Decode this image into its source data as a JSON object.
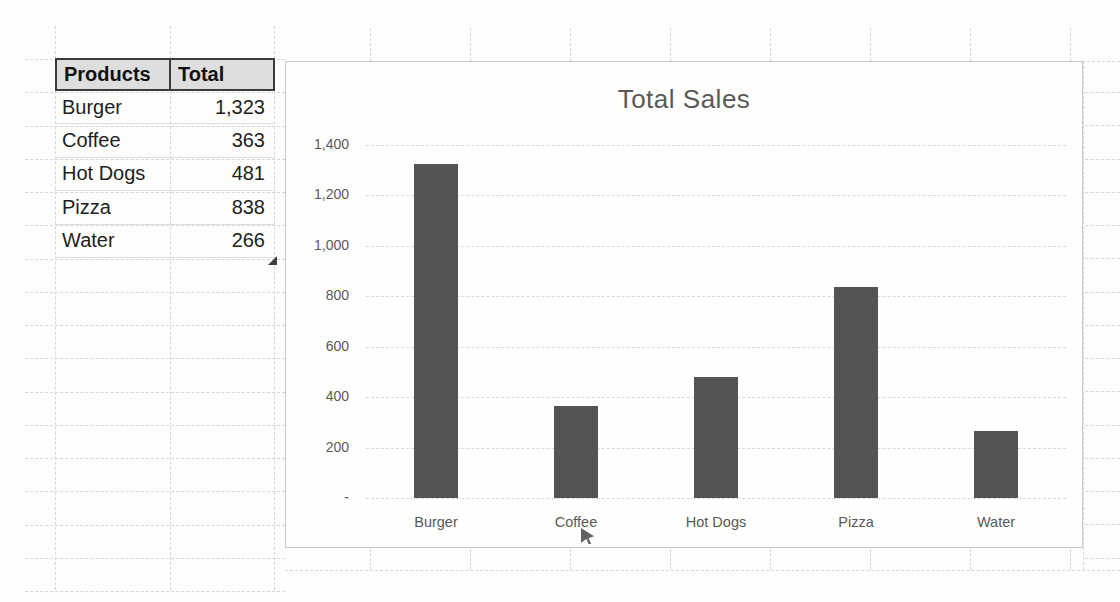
{
  "table": {
    "headers": [
      "Products",
      "Total"
    ],
    "rows": [
      {
        "product": "Burger",
        "total": "1,323"
      },
      {
        "product": "Coffee",
        "total": "363"
      },
      {
        "product": "Hot Dogs",
        "total": "481"
      },
      {
        "product": "Pizza",
        "total": "838"
      },
      {
        "product": "Water",
        "total": "266"
      }
    ]
  },
  "chart_data": {
    "type": "bar",
    "title": "Total Sales",
    "categories": [
      "Burger",
      "Coffee",
      "Hot Dogs",
      "Pizza",
      "Water"
    ],
    "values": [
      1323,
      363,
      481,
      838,
      266
    ],
    "xlabel": "",
    "ylabel": "",
    "ylim": [
      0,
      1400
    ],
    "ytick_step": 200,
    "ytick_labels": [
      "-",
      "200",
      "400",
      "600",
      "800",
      "1,000",
      "1,200",
      "1,400"
    ],
    "bar_color": "#545454",
    "grid": true,
    "legend": false
  },
  "colors": {
    "bar": "#545454",
    "chart_text": "#595959",
    "table_header_fill": "#dedede",
    "table_border": "#3b3b3b",
    "gridline": "#d3d6da"
  }
}
